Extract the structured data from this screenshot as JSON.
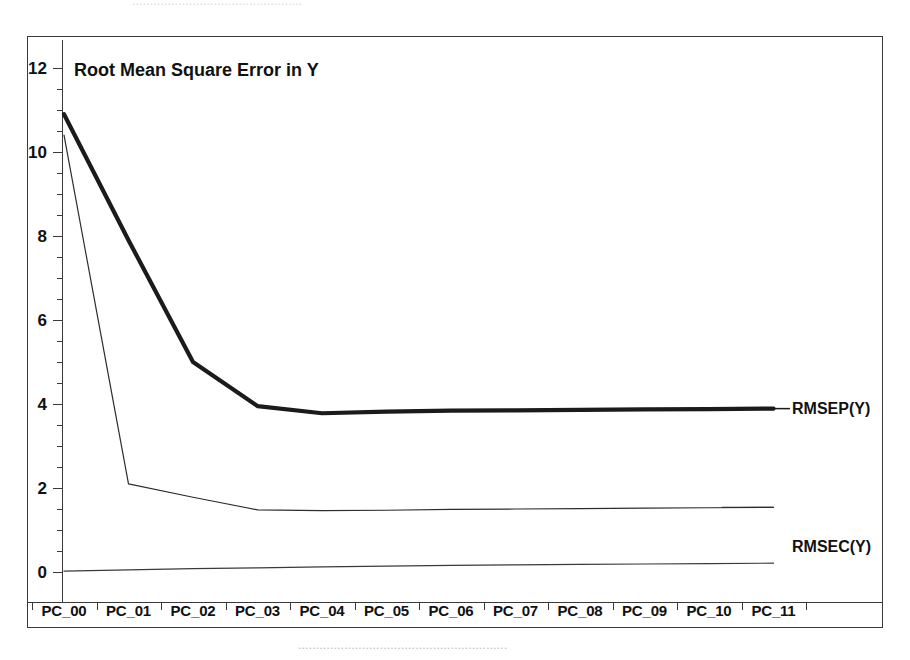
{
  "chart_data": {
    "type": "line",
    "title": "Root Mean Square Error in Y",
    "xlabel": "",
    "ylabel": "",
    "categories": [
      "PC_00",
      "PC_01",
      "PC_02",
      "PC_03",
      "PC_04",
      "PC_05",
      "PC_06",
      "PC_07",
      "PC_08",
      "PC_09",
      "PC_10",
      "PC_11"
    ],
    "ylim": [
      0,
      12
    ],
    "yticks": [
      0,
      2,
      4,
      6,
      8,
      10,
      12
    ],
    "ytick_labels": [
      "0",
      "2",
      "4",
      "6",
      "8",
      "10",
      "12"
    ],
    "minor_ticks": true,
    "grid": false,
    "legend_position": "right-inline",
    "series": [
      {
        "name": "RMSEP(Y)",
        "label": "RMSEP(Y)",
        "style": "thick",
        "color": "#1b1b1b",
        "values": [
          10.9,
          7.9,
          5.0,
          3.95,
          3.78,
          3.82,
          3.84,
          3.85,
          3.86,
          3.87,
          3.88,
          3.89
        ]
      },
      {
        "name": "RMSEC(Y)",
        "label": "RMSEC(Y)",
        "style": "thin",
        "color": "#2d2d2d",
        "values": [
          10.4,
          2.1,
          1.78,
          1.48,
          1.46,
          1.47,
          1.49,
          1.5,
          1.51,
          1.52,
          1.53,
          1.54
        ]
      },
      {
        "name": "baseline",
        "label": "",
        "style": "thin",
        "color": "#3a3a3a",
        "values": [
          0.02,
          0.05,
          0.08,
          0.1,
          0.12,
          0.14,
          0.16,
          0.17,
          0.18,
          0.19,
          0.2,
          0.21
        ]
      }
    ]
  },
  "series_labels": {
    "rmsep": "RMSEP(Y)",
    "rmsec": "RMSEC(Y)"
  },
  "artifacts": {
    "top_text": "................................................",
    "bottom_text": "..........................................................."
  }
}
